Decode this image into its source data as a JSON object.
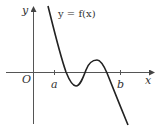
{
  "diagram": {
    "function_label": "y = f(x)",
    "axes": {
      "x_label": "x",
      "y_label": "y",
      "origin_label": "O"
    },
    "ticks": [
      {
        "label": "a"
      },
      {
        "label": "b"
      }
    ],
    "colors": {
      "curve": "#222222",
      "axis": "#555555",
      "text": "#333333"
    }
  }
}
